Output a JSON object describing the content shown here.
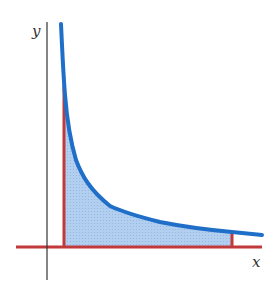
{
  "figure": {
    "axes": {
      "x_label": "x",
      "y_label": "y"
    },
    "colors": {
      "curve": "#1f6fc9",
      "shade": "#a9c8ee",
      "bounds": "#c0393b",
      "axis": "#333333"
    }
  }
}
